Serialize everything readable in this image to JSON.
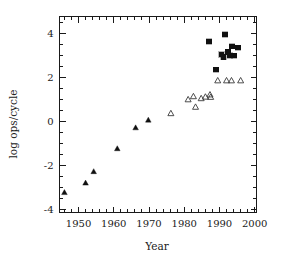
{
  "chart_data": {
    "type": "scatter",
    "title": "",
    "xlabel": "Year",
    "ylabel": "log ops/cycle",
    "xlim": [
      1944.6,
      2000.5
    ],
    "ylim": [
      -4.15,
      4.75
    ],
    "grid": false,
    "legend": null,
    "xticks_major": [
      1950,
      1960,
      1970,
      1980,
      1990,
      2000
    ],
    "xtick_labels": [
      "1950",
      "1960",
      "1970",
      "1980",
      "1990",
      "2000"
    ],
    "xticks_minor_step": 2,
    "yticks_major": [
      -4,
      -2,
      0,
      2,
      4
    ],
    "ytick_labels": [
      "-4",
      "-2",
      "0",
      "2",
      "4"
    ],
    "yticks_minor_step": 0.5,
    "series": [
      {
        "name": "filled-triangle",
        "marker": "filled_triangle",
        "color": "#101010",
        "points": [
          {
            "x": 1946.0,
            "y": -3.25
          },
          {
            "x": 1952.0,
            "y": -2.82
          },
          {
            "x": 1954.3,
            "y": -2.3
          },
          {
            "x": 1961.0,
            "y": -1.26
          },
          {
            "x": 1966.2,
            "y": -0.31
          },
          {
            "x": 1969.8,
            "y": 0.04
          }
        ]
      },
      {
        "name": "open-triangle",
        "marker": "open_triangle",
        "color": "#3a3a3a",
        "points": [
          {
            "x": 1976.2,
            "y": 0.34
          },
          {
            "x": 1981.1,
            "y": 0.97
          },
          {
            "x": 1982.6,
            "y": 1.11
          },
          {
            "x": 1983.2,
            "y": 0.63
          },
          {
            "x": 1984.8,
            "y": 1.02
          },
          {
            "x": 1986.0,
            "y": 1.09
          },
          {
            "x": 1987.3,
            "y": 1.19
          },
          {
            "x": 1987.5,
            "y": 1.08
          },
          {
            "x": 1989.5,
            "y": 1.83
          },
          {
            "x": 1992.0,
            "y": 1.83
          },
          {
            "x": 1993.4,
            "y": 1.83
          },
          {
            "x": 1996.0,
            "y": 1.83
          }
        ]
      },
      {
        "name": "filled-square",
        "marker": "filled_square",
        "color": "#101010",
        "points": [
          {
            "x": 1987.0,
            "y": 3.61
          },
          {
            "x": 1989.0,
            "y": 2.33
          },
          {
            "x": 1990.6,
            "y": 3.03
          },
          {
            "x": 1991.1,
            "y": 2.92
          },
          {
            "x": 1991.6,
            "y": 3.93
          },
          {
            "x": 1992.4,
            "y": 3.14
          },
          {
            "x": 1993.0,
            "y": 2.98
          },
          {
            "x": 1993.6,
            "y": 3.4
          },
          {
            "x": 1995.2,
            "y": 3.33
          },
          {
            "x": 1994.1,
            "y": 2.97
          }
        ]
      }
    ]
  }
}
